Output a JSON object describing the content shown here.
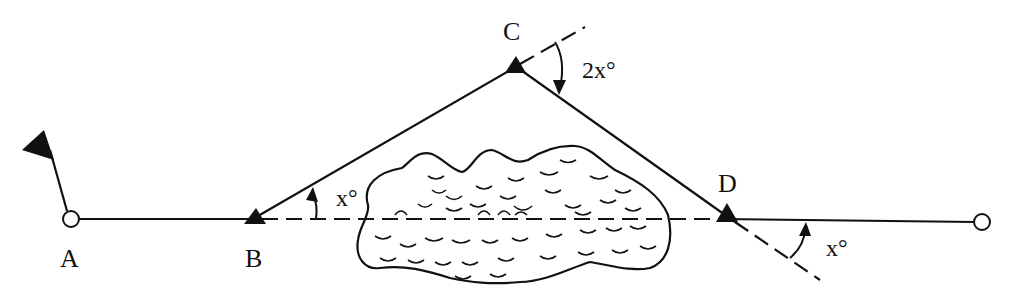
{
  "diagram": {
    "points": {
      "A": {
        "label": "A",
        "type": "station-circle-with-flag"
      },
      "B": {
        "label": "B",
        "type": "triangle-station"
      },
      "C": {
        "label": "C",
        "type": "triangle-station"
      },
      "D": {
        "label": "D",
        "type": "triangle-station"
      },
      "end": {
        "label": "",
        "type": "station-circle"
      }
    },
    "angles": {
      "at_B": "x°",
      "at_C": "2x°",
      "at_D": "x°"
    },
    "obstacle": "lake"
  }
}
